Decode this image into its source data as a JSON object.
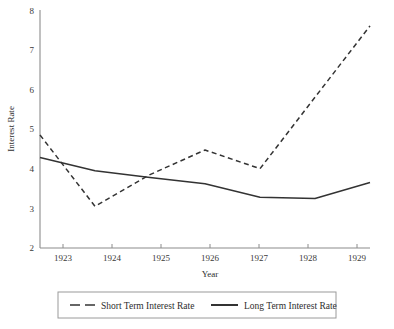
{
  "chart_data": {
    "type": "line",
    "title": "",
    "xlabel": "Year",
    "ylabel": "Interest Rate",
    "x": [
      1923,
      1924,
      1925,
      1926,
      1927,
      1928,
      1929
    ],
    "categories": [
      "1923",
      "1924",
      "1925",
      "1926",
      "1927",
      "1928",
      "1929"
    ],
    "xlim": [
      1923,
      1929
    ],
    "ylim": [
      2,
      8
    ],
    "yticks": [
      2,
      3,
      4,
      5,
      6,
      7,
      8
    ],
    "ytick_labels": [
      "2",
      "3",
      "4",
      "5",
      "6",
      "7",
      "8"
    ],
    "xticks": [
      1923,
      1924,
      1925,
      1926,
      1927,
      1928,
      1929
    ],
    "xtick_labels": [
      "1923",
      "1924",
      "1925",
      "1926",
      "1927",
      "1928",
      "1929"
    ],
    "grid": false,
    "legend_position": "bottom",
    "series": [
      {
        "name": "Short Term Interest Rate",
        "style": "dashed",
        "color": "#333333",
        "values": [
          4.85,
          3.05,
          3.85,
          4.47,
          4.0,
          5.8,
          7.6
        ]
      },
      {
        "name": "Long Term Interest Rate",
        "style": "solid",
        "color": "#333333",
        "values": [
          4.28,
          3.95,
          3.78,
          3.62,
          3.28,
          3.25,
          3.65
        ]
      }
    ]
  },
  "legend": {
    "entries": [
      {
        "label": "Short Term Interest Rate",
        "style": "dashed"
      },
      {
        "label": "Long Term Interest Rate",
        "style": "solid"
      }
    ]
  },
  "axis": {
    "y_title": "Interest Rate",
    "x_title": "Year"
  }
}
